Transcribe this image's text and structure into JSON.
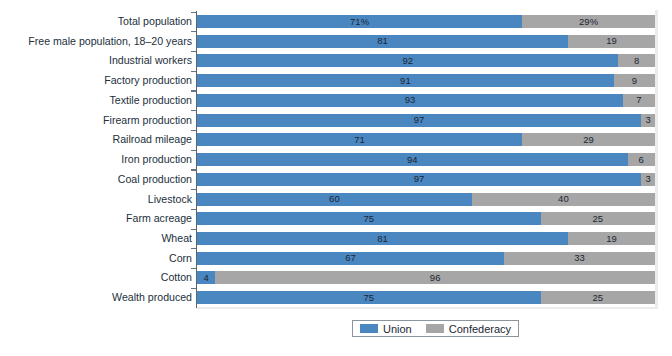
{
  "chart_data": {
    "type": "bar",
    "subtype": "stacked-horizontal-100-percent",
    "title": "",
    "xlabel": "",
    "ylabel": "",
    "xlim": [
      0,
      100
    ],
    "grid": false,
    "legend_position": "bottom-center",
    "categories": [
      "Total population",
      "Free male population, 18–20 years",
      "Industrial workers",
      "Factory production",
      "Textile production",
      "Firearm production",
      "Railroad mileage",
      "Iron production",
      "Coal production",
      "Livestock",
      "Farm acreage",
      "Wheat",
      "Corn",
      "Cotton",
      "Wealth produced"
    ],
    "series": [
      {
        "name": "Union",
        "color": "#4a86c0",
        "values": [
          71,
          81,
          92,
          91,
          93,
          97,
          71,
          94,
          97,
          60,
          75,
          81,
          67,
          4,
          75
        ],
        "labels": [
          "71%",
          "81",
          "92",
          "91",
          "93",
          "97",
          "71",
          "94",
          "97",
          "60",
          "75",
          "81",
          "67",
          "4",
          "75"
        ]
      },
      {
        "name": "Confederacy",
        "color": "#a6a6a6",
        "values": [
          29,
          19,
          8,
          9,
          7,
          3,
          29,
          6,
          3,
          40,
          25,
          19,
          33,
          96,
          25
        ],
        "labels": [
          "29%",
          "19",
          "8",
          "9",
          "7",
          "3",
          "29",
          "6",
          "3",
          "40",
          "25",
          "19",
          "33",
          "96",
          "25"
        ]
      }
    ]
  },
  "legend": {
    "entries": [
      {
        "label": "Union",
        "color": "#4a86c0"
      },
      {
        "label": "Confederacy",
        "color": "#a6a6a6"
      }
    ]
  }
}
